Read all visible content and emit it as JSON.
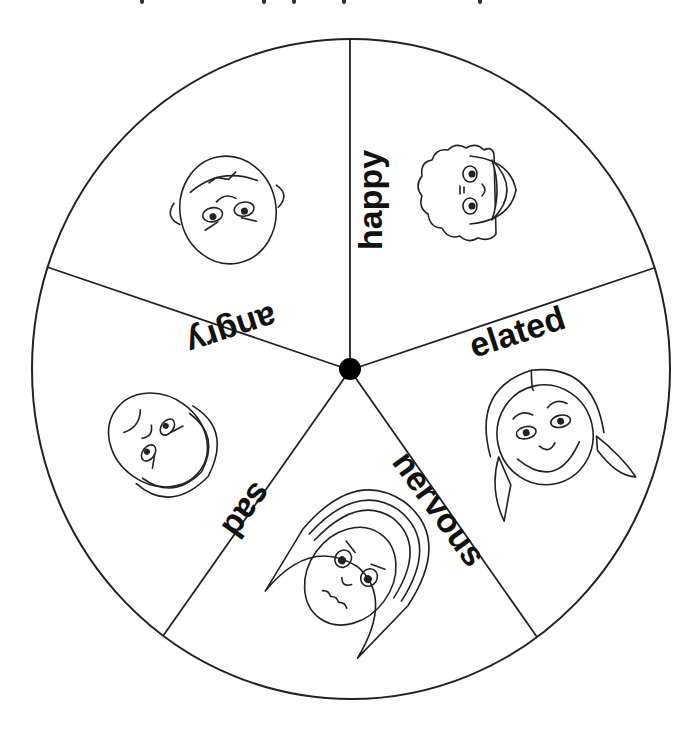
{
  "wheel": {
    "center": {
      "x": 350,
      "y": 370
    },
    "radius_x": 319,
    "radius_y": 330,
    "stroke_color": "#222222",
    "hub_color": "#000000",
    "segments": [
      {
        "label": "happy",
        "face": "curly-haired-smiling-face-icon"
      },
      {
        "label": "elated",
        "face": "pigtails-girl-grinning-face-icon"
      },
      {
        "label": "nervous",
        "face": "long-haired-worried-face-icon"
      },
      {
        "label": "sad",
        "face": "frowning-face-icon"
      },
      {
        "label": "angry",
        "face": "bald-scowling-face-icon"
      }
    ]
  }
}
